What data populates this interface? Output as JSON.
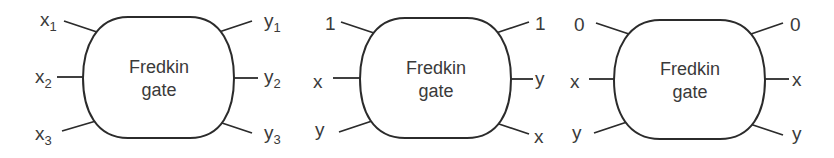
{
  "diagram": {
    "colors": {
      "stroke": "#2b2b2b",
      "text": "#3a3a3a",
      "background": "#ffffff"
    },
    "gates": [
      {
        "label_line1": "Fredkin",
        "label_line2": "gate",
        "inputs": [
          {
            "name": "x",
            "sub": "1"
          },
          {
            "name": "x",
            "sub": "2"
          },
          {
            "name": "x",
            "sub": "3"
          }
        ],
        "outputs": [
          {
            "name": "y",
            "sub": "1"
          },
          {
            "name": "y",
            "sub": "2"
          },
          {
            "name": "y",
            "sub": "3"
          }
        ]
      },
      {
        "label_line1": "Fredkin",
        "label_line2": "gate",
        "inputs": [
          {
            "name": "1"
          },
          {
            "name": "x"
          },
          {
            "name": "y"
          }
        ],
        "outputs": [
          {
            "name": "1"
          },
          {
            "name": "y"
          },
          {
            "name": "x"
          }
        ]
      },
      {
        "label_line1": "Fredkin",
        "label_line2": "gate",
        "inputs": [
          {
            "name": "0"
          },
          {
            "name": "x"
          },
          {
            "name": "y"
          }
        ],
        "outputs": [
          {
            "name": "0"
          },
          {
            "name": "x"
          },
          {
            "name": "y"
          }
        ]
      }
    ]
  }
}
